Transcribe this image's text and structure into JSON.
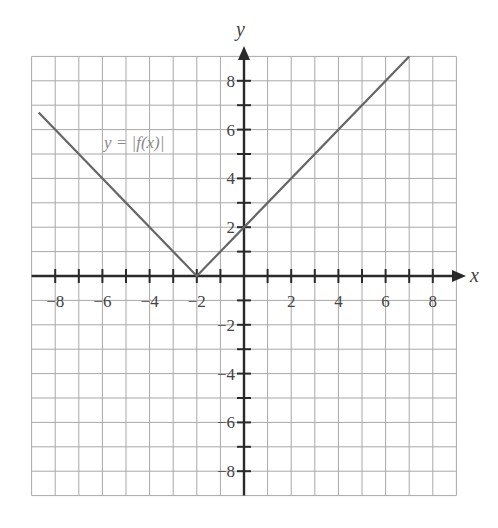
{
  "chart_data": {
    "type": "line",
    "title": "",
    "xlabel": "x",
    "ylabel": "y",
    "xlim": [
      -9,
      9
    ],
    "ylim": [
      -9,
      9
    ],
    "grid": true,
    "x_ticks": [
      -8,
      -6,
      -4,
      -2,
      2,
      4,
      6,
      8
    ],
    "y_ticks": [
      8,
      6,
      4,
      2,
      -2,
      -4,
      -6,
      -8
    ],
    "series": [
      {
        "name": "y = |f(x)|",
        "x": [
          -8.7,
          -2,
          7
        ],
        "y": [
          6.7,
          0,
          9
        ]
      }
    ],
    "annotations": [
      {
        "text": "y = |f(x)|",
        "x": -4.5,
        "y": 5.5
      }
    ]
  },
  "labels": {
    "x_axis": "x",
    "y_axis": "y",
    "curve_label": "y = |f(x)|",
    "x_tick_labels": [
      "−8",
      "−6",
      "−4",
      "−2",
      "2",
      "4",
      "6",
      "8"
    ],
    "y_tick_labels": [
      "8",
      "6",
      "4",
      "2",
      "−2",
      "−4",
      "−6",
      "−8"
    ]
  }
}
